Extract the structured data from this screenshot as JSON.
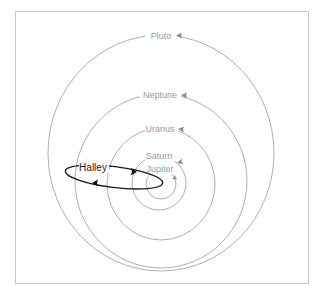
{
  "diagram": {
    "type": "orbital-diagram",
    "colors": {
      "planet_orbit": "#9a9a9a",
      "comet_orbit": "#1a1a1a",
      "frame": "#c8c8c8",
      "background": "#ffffff"
    },
    "orbits": [
      {
        "name": "Pluto",
        "label": "Pluto"
      },
      {
        "name": "Neptune",
        "label": "Neptune"
      },
      {
        "name": "Uranus",
        "label": "Uranus"
      },
      {
        "name": "Saturn",
        "label": "Saturn"
      },
      {
        "name": "Jupiter",
        "label": "Jupiter"
      }
    ],
    "comet": {
      "name": "Halley",
      "label": "Halley"
    }
  }
}
